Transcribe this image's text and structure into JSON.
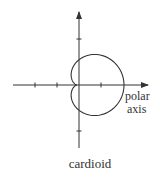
{
  "figure": {
    "title": "cardioid",
    "axis_label_line1": "polar",
    "axis_label_line2": "axis",
    "stroke_color": "#333333",
    "background": "#ffffff"
  },
  "chart_data": {
    "type": "line",
    "title": "cardioid",
    "equation": "r = a(1 + cos θ)",
    "annotations": [
      "polar",
      "axis"
    ],
    "origin_px": [
      77,
      85
    ],
    "a_units": 1,
    "tick_spacing_px": 22,
    "x_ticks": [
      -2,
      -1,
      1
    ],
    "y_ticks": [
      2,
      -2
    ],
    "xlim": [
      -3,
      3
    ],
    "ylim": [
      -3,
      3
    ],
    "grid": false
  }
}
